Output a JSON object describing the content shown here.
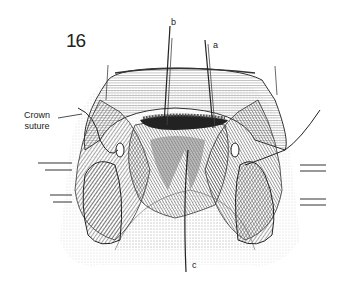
{
  "figure": {
    "number": "16",
    "labels": {
      "a": "a",
      "b": "b",
      "c": "c",
      "crown_line1": "Crown",
      "crown_line2": "suture"
    }
  }
}
